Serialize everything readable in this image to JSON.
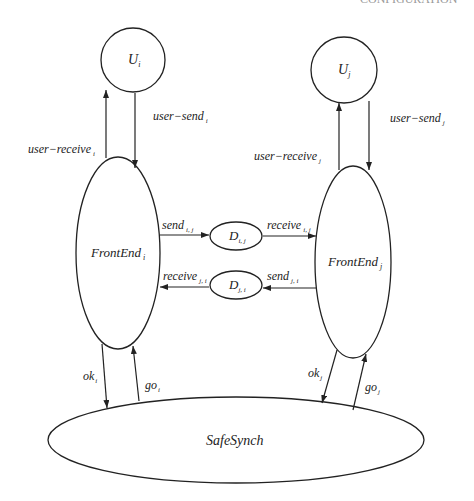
{
  "header": {
    "clipped_text": "CONFIGURATION"
  },
  "nodes": {
    "u_i": {
      "label": "U",
      "sub": "i"
    },
    "u_j": {
      "label": "U",
      "sub": "j"
    },
    "frontend_i": {
      "label": "FrontEnd",
      "sub": "i"
    },
    "frontend_j": {
      "label": "FrontEnd",
      "sub": "j"
    },
    "d_ij": {
      "label": "D",
      "sub": "i, j"
    },
    "d_ji": {
      "label": "D",
      "sub": "j, i"
    },
    "safesynch": {
      "label": "SafeSynch"
    }
  },
  "edges": {
    "user_send_i": {
      "label": "user−send",
      "sub": "i"
    },
    "user_receive_i": {
      "label": "user−receive",
      "sub": "i"
    },
    "user_send_j": {
      "label": "user−send",
      "sub": "j"
    },
    "user_receive_j": {
      "label": "user−receive",
      "sub": "j"
    },
    "send_ij": {
      "label": "send",
      "sub": "i, j"
    },
    "receive_ij": {
      "label": "receive",
      "sub": "i, j"
    },
    "send_ji": {
      "label": "send",
      "sub": "j, i"
    },
    "receive_ji": {
      "label": "receive",
      "sub": "j, i"
    },
    "ok_i": {
      "label": "ok",
      "sub": "i"
    },
    "go_i": {
      "label": "go",
      "sub": "i"
    },
    "ok_j": {
      "label": "ok",
      "sub": "j"
    },
    "go_j": {
      "label": "go",
      "sub": "j"
    }
  }
}
